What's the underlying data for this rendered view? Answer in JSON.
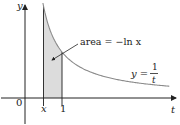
{
  "diagram": {
    "function": "y = 1/t",
    "x_value": 0.5,
    "shaded_interval": [
      0.5,
      1
    ],
    "t_range": [
      0,
      3.9
    ],
    "colors": {
      "curve": "#8a8a8a",
      "shade": "#dcdcdc",
      "axis": "#222222",
      "guide": "#333333"
    }
  },
  "labels": {
    "y_axis": "y",
    "t_axis": "t",
    "origin": "0",
    "x_tick": "x",
    "one_tick": "1",
    "area_text": "area = −ln x",
    "curve_lhs": "y =",
    "curve_num": "1",
    "curve_den": "t"
  }
}
